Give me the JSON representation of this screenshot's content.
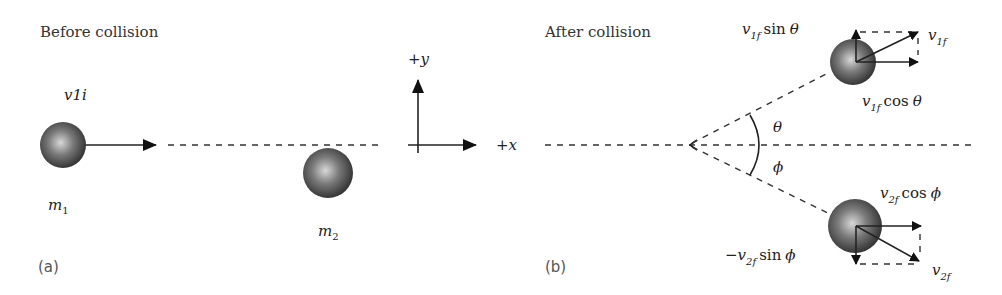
{
  "panel_a": {
    "title": "Before collision",
    "label": "(a)",
    "velocity_label": "v1i",
    "mass1": {
      "symbol": "m",
      "subscript": "1"
    },
    "mass2": {
      "symbol": "m",
      "subscript": "2"
    },
    "axes": {
      "x_label": "+x",
      "y_label": "+y"
    }
  },
  "panel_b": {
    "title": "After collision",
    "label": "(b)",
    "angle_upper": "θ",
    "angle_lower": "ϕ",
    "ball1": {
      "v_symbol": "v",
      "v_sub": "1f",
      "sin_component": {
        "prefix": "",
        "symbol": "v",
        "sub": "1f",
        "func": "sin",
        "angle": "θ"
      },
      "cos_component": {
        "prefix": "",
        "symbol": "v",
        "sub": "1f",
        "func": "cos",
        "angle": "θ"
      }
    },
    "ball2": {
      "v_symbol": "v",
      "v_sub": "2f",
      "sin_component": {
        "prefix": "−",
        "symbol": "v",
        "sub": "2f",
        "func": "sin",
        "angle": "ϕ"
      },
      "cos_component": {
        "prefix": "",
        "symbol": "v",
        "sub": "2f",
        "func": "cos",
        "angle": "ϕ"
      }
    }
  },
  "colors": {
    "ball_center": "#d8d8d8",
    "ball_edge": "#2a2a2a",
    "line": "#222222",
    "text": "#222222"
  }
}
